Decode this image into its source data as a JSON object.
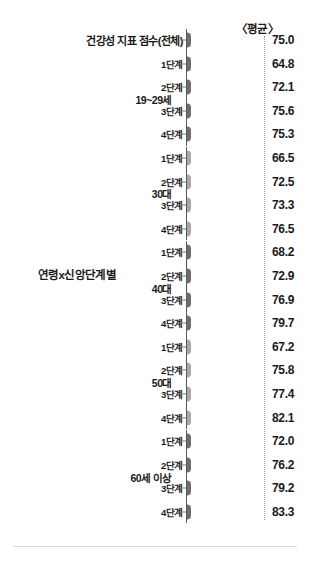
{
  "header": {
    "average_label": "〈평균〉"
  },
  "row_dimension": {
    "label": "연령x신앙단계별"
  },
  "chart_data": {
    "type": "bar",
    "orientation": "horizontal",
    "title": "연령x신앙단계별",
    "xlabel": "",
    "ylabel": "",
    "value_header": "〈평균〉",
    "xlim": [
      0,
      100
    ],
    "reference_line": 75.0,
    "grid": false,
    "legend": "none",
    "categories": [
      "건강성 지표 점수(전체)",
      "1단계",
      "2단계",
      "3단계",
      "4단계",
      "1단계",
      "2단계",
      "3단계",
      "4단계",
      "1단계",
      "2단계",
      "3단계",
      "4단계",
      "1단계",
      "2단계",
      "3단계",
      "4단계",
      "1단계",
      "2단계",
      "3단계",
      "4단계"
    ],
    "values": [
      75.0,
      64.8,
      72.1,
      75.6,
      75.3,
      66.5,
      72.5,
      73.3,
      76.5,
      68.2,
      72.9,
      76.9,
      79.7,
      67.2,
      75.8,
      77.4,
      82.1,
      72.0,
      76.2,
      79.2,
      83.3
    ],
    "groups": [
      {
        "name": "",
        "label": "",
        "color": "#6e6e6e",
        "categories": [
          "건강성 지표 점수(전체)"
        ],
        "values": [
          75.0
        ]
      },
      {
        "name": "19~29세",
        "label": "19~29세",
        "color": "#6e6e6e",
        "categories": [
          "1단계",
          "2단계",
          "3단계",
          "4단계"
        ],
        "values": [
          64.8,
          72.1,
          75.6,
          75.3
        ]
      },
      {
        "name": "30대",
        "label": "30대",
        "color": "#a8a8a8",
        "categories": [
          "1단계",
          "2단계",
          "3단계",
          "4단계"
        ],
        "values": [
          66.5,
          72.5,
          73.3,
          76.5
        ]
      },
      {
        "name": "40대",
        "label": "40대",
        "color": "#6e6e6e",
        "categories": [
          "1단계",
          "2단계",
          "3단계",
          "4단계"
        ],
        "values": [
          68.2,
          72.9,
          76.9,
          79.7
        ]
      },
      {
        "name": "50대",
        "label": "50대",
        "color": "#a8a8a8",
        "categories": [
          "1단계",
          "2단계",
          "3단계",
          "4단계"
        ],
        "values": [
          67.2,
          75.8,
          77.4,
          82.1
        ]
      },
      {
        "name": "60세 이상",
        "label": "60세 이상",
        "color": "#6e6e6e",
        "categories": [
          "1단계",
          "2단계",
          "3단계",
          "4단계"
        ],
        "values": [
          72.0,
          76.2,
          79.2,
          83.3
        ]
      }
    ]
  },
  "rows": [
    {
      "label": "건강성 지표 점수(전체)",
      "value": "75.0",
      "value_num": 75.0,
      "color": "#6e6e6e",
      "big": true,
      "group_start": true
    },
    {
      "label": "1단계",
      "value": "64.8",
      "value_num": 64.8,
      "color": "#6e6e6e",
      "big": false,
      "group_start": true
    },
    {
      "label": "2단계",
      "value": "72.1",
      "value_num": 72.1,
      "color": "#6e6e6e",
      "big": false,
      "group_start": false
    },
    {
      "label": "3단계",
      "value": "75.6",
      "value_num": 75.6,
      "color": "#6e6e6e",
      "big": false,
      "group_start": false
    },
    {
      "label": "4단계",
      "value": "75.3",
      "value_num": 75.3,
      "color": "#6e6e6e",
      "big": false,
      "group_start": false
    },
    {
      "label": "1단계",
      "value": "66.5",
      "value_num": 66.5,
      "color": "#a8a8a8",
      "big": false,
      "group_start": true
    },
    {
      "label": "2단계",
      "value": "72.5",
      "value_num": 72.5,
      "color": "#a8a8a8",
      "big": false,
      "group_start": false
    },
    {
      "label": "3단계",
      "value": "73.3",
      "value_num": 73.3,
      "color": "#a8a8a8",
      "big": false,
      "group_start": false
    },
    {
      "label": "4단계",
      "value": "76.5",
      "value_num": 76.5,
      "color": "#a8a8a8",
      "big": false,
      "group_start": false
    },
    {
      "label": "1단계",
      "value": "68.2",
      "value_num": 68.2,
      "color": "#6e6e6e",
      "big": false,
      "group_start": true
    },
    {
      "label": "2단계",
      "value": "72.9",
      "value_num": 72.9,
      "color": "#6e6e6e",
      "big": false,
      "group_start": false
    },
    {
      "label": "3단계",
      "value": "76.9",
      "value_num": 76.9,
      "color": "#6e6e6e",
      "big": false,
      "group_start": false
    },
    {
      "label": "4단계",
      "value": "79.7",
      "value_num": 79.7,
      "color": "#6e6e6e",
      "big": false,
      "group_start": false
    },
    {
      "label": "1단계",
      "value": "67.2",
      "value_num": 67.2,
      "color": "#a8a8a8",
      "big": false,
      "group_start": true
    },
    {
      "label": "2단계",
      "value": "75.8",
      "value_num": 75.8,
      "color": "#a8a8a8",
      "big": false,
      "group_start": false
    },
    {
      "label": "3단계",
      "value": "77.4",
      "value_num": 77.4,
      "color": "#a8a8a8",
      "big": false,
      "group_start": false
    },
    {
      "label": "4단계",
      "value": "82.1",
      "value_num": 82.1,
      "color": "#a8a8a8",
      "big": false,
      "group_start": false
    },
    {
      "label": "1단계",
      "value": "72.0",
      "value_num": 72.0,
      "color": "#6e6e6e",
      "big": false,
      "group_start": true
    },
    {
      "label": "2단계",
      "value": "76.2",
      "value_num": 76.2,
      "color": "#6e6e6e",
      "big": false,
      "group_start": false
    },
    {
      "label": "3단계",
      "value": "79.2",
      "value_num": 79.2,
      "color": "#6e6e6e",
      "big": false,
      "group_start": false
    },
    {
      "label": "4단계",
      "value": "83.3",
      "value_num": 83.3,
      "color": "#6e6e6e",
      "big": false,
      "group_start": false
    }
  ],
  "group_labels": [
    {
      "label": "19~29세",
      "row_center": 3
    },
    {
      "label": "30대",
      "row_center": 7
    },
    {
      "label": "40대",
      "row_center": 11
    },
    {
      "label": "50대",
      "row_center": 15
    },
    {
      "label": "60세 이상",
      "row_center": 19
    }
  ]
}
